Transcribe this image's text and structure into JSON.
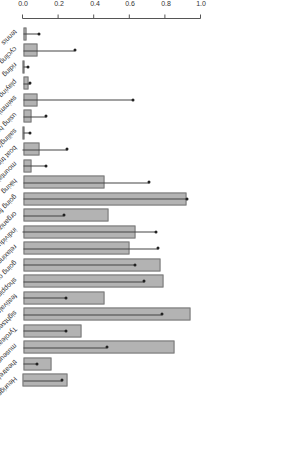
{
  "chart_data": {
    "type": "bar",
    "orientation": "rotated-180",
    "title": "",
    "xlabel": "",
    "ylabel": "Percent",
    "ylim": [
      0,
      1.0
    ],
    "yticks": [
      "0.0",
      "0.2",
      "0.4",
      "0.6",
      "0.8",
      "1.0"
    ],
    "categories": [
      "tennis",
      "cycling",
      "riding",
      "playing golf",
      "swimming/bathing",
      "using health facilities",
      "sailing/surfing",
      "boat trips",
      "mountaineering",
      "hiking",
      "going for walks",
      "organized excursions",
      "individual excursions",
      "relaxing/doing nothing",
      "going out for dinner",
      "shopping",
      "festivals/concerts",
      "sightseeing",
      "Tyrolean evenings",
      "museum/exhibitions",
      "theatre/musicals/opera",
      "Heuriger"
    ],
    "series": [
      {
        "name": "bar",
        "values": [
          0.02,
          0.08,
          0.01,
          0.03,
          0.08,
          0.05,
          0.01,
          0.09,
          0.05,
          0.46,
          0.92,
          0.48,
          0.63,
          0.6,
          0.77,
          0.79,
          0.46,
          0.94,
          0.33,
          0.85,
          0.16,
          0.25
        ]
      },
      {
        "name": "point",
        "values": [
          0.09,
          0.29,
          0.03,
          0.04,
          0.62,
          0.13,
          0.04,
          0.25,
          0.13,
          0.71,
          0.92,
          0.23,
          0.75,
          0.76,
          0.63,
          0.68,
          0.24,
          0.78,
          0.24,
          0.47,
          0.08,
          0.22
        ]
      }
    ],
    "grid": false,
    "legend": null
  }
}
